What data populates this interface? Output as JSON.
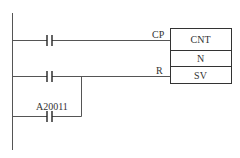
{
  "diagram": {
    "type": "ladder",
    "instruction_box": {
      "rows": [
        "CNT",
        "N",
        "SV"
      ]
    },
    "inputs": {
      "count_pin": "CP",
      "reset_pin": "R"
    },
    "contacts": [
      {
        "rung": 1,
        "label": ""
      },
      {
        "rung": 2,
        "label": ""
      },
      {
        "rung": 2,
        "branch": true,
        "label": "A20011"
      }
    ]
  }
}
